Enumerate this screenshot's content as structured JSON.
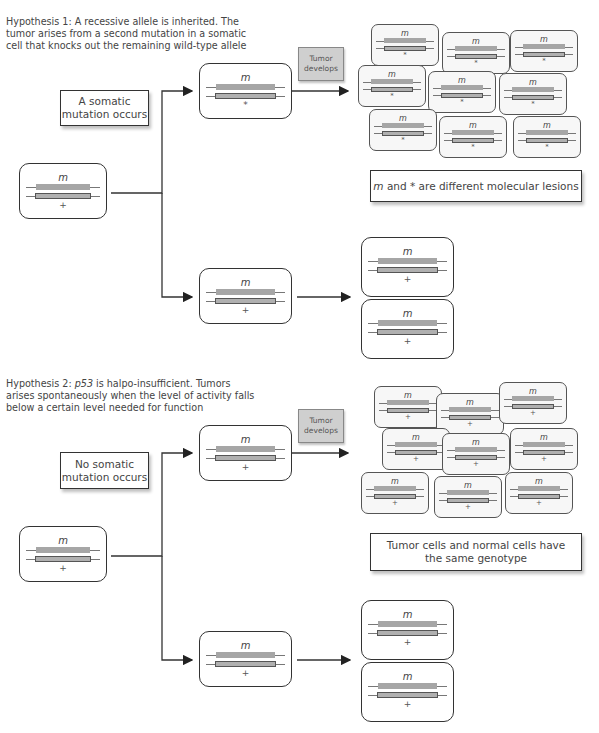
{
  "hypothesis1": {
    "title_prefix": "Hypothesis 1:",
    "line1": "Hypothesis 1: A recessive allele is inherited. The",
    "line2": "tumor arises from a second mutation in a somatic",
    "line3": "cell that knocks out the remaining wild-type allele",
    "event_label_line1": "A somatic",
    "event_label_line2": "mutation occurs",
    "tumor_label_line1": "Tumor",
    "tumor_label_line2": "develops",
    "conclusion_italic": "m",
    "conclusion_rest": " and * are different molecular lesions",
    "parent_cell": {
      "top_allele": "m",
      "bottom_allele": "+"
    },
    "mutated_cell": {
      "top_allele": "m",
      "bottom_allele": "*"
    },
    "normal_cell": {
      "top_allele": "m",
      "bottom_allele": "+"
    },
    "tumor_cells": [
      {
        "top_allele": "m",
        "bottom_allele": "*"
      },
      {
        "top_allele": "m",
        "bottom_allele": "*"
      },
      {
        "top_allele": "m",
        "bottom_allele": "*"
      },
      {
        "top_allele": "m",
        "bottom_allele": "*"
      },
      {
        "top_allele": "m",
        "bottom_allele": "*"
      },
      {
        "top_allele": "m",
        "bottom_allele": "*"
      },
      {
        "top_allele": "m",
        "bottom_allele": "*"
      },
      {
        "top_allele": "m",
        "bottom_allele": "*"
      },
      {
        "top_allele": "m",
        "bottom_allele": "*"
      }
    ],
    "daughter_cells": [
      {
        "top_allele": "m",
        "bottom_allele": "+"
      },
      {
        "top_allele": "m",
        "bottom_allele": "+"
      }
    ]
  },
  "hypothesis2": {
    "line1_prefix": "Hypothesis 2: ",
    "line1_gene": "p53",
    "line1_suffix": " is halpo-insufficient. Tumors",
    "line2": "arises spontaneously when the level of activity falls",
    "line3": "below a certain level needed for function",
    "event_label_line1": "No somatic",
    "event_label_line2": "mutation occurs",
    "tumor_label_line1": "Tumor",
    "tumor_label_line2": "develops",
    "conclusion_line1": "Tumor cells and normal cells have",
    "conclusion_line2": "the same genotype",
    "parent_cell": {
      "top_allele": "m",
      "bottom_allele": "+"
    },
    "upper_cell": {
      "top_allele": "m",
      "bottom_allele": "+"
    },
    "normal_cell": {
      "top_allele": "m",
      "bottom_allele": "+"
    },
    "tumor_cells": [
      {
        "top_allele": "m",
        "bottom_allele": "+"
      },
      {
        "top_allele": "m",
        "bottom_allele": "+"
      },
      {
        "top_allele": "m",
        "bottom_allele": "+"
      },
      {
        "top_allele": "m",
        "bottom_allele": "+"
      },
      {
        "top_allele": "m",
        "bottom_allele": "+"
      },
      {
        "top_allele": "m",
        "bottom_allele": "+"
      },
      {
        "top_allele": "m",
        "bottom_allele": "+"
      },
      {
        "top_allele": "m",
        "bottom_allele": "+"
      },
      {
        "top_allele": "m",
        "bottom_allele": "+"
      }
    ],
    "daughter_cells": [
      {
        "top_allele": "m",
        "bottom_allele": "+"
      },
      {
        "top_allele": "m",
        "bottom_allele": "+"
      }
    ]
  },
  "colors": {
    "line": "#333333",
    "bar_fill": "#a6a6a6",
    "tumor_box": "#cfcfcf",
    "small_cell_bg": "#f7f7f7"
  }
}
